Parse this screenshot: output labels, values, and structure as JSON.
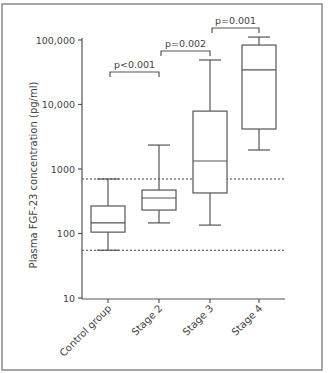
{
  "chart_data": {
    "type": "box",
    "title": "",
    "xlabel": "",
    "ylabel": "Plasma FGF-23 concentration (pg/ml)",
    "yscale": "log",
    "ylim": [
      10,
      100000
    ],
    "yticks": [
      10,
      100,
      1000,
      10000,
      100000
    ],
    "ytick_labels": [
      "10",
      "100",
      "1000",
      "10,000",
      "100,000"
    ],
    "categories": [
      "Control group",
      "Stage 2",
      "Stage 3",
      "Stage 4"
    ],
    "series": [
      {
        "name": "Control group",
        "whisker_low": 55,
        "q1": 105,
        "median": 146,
        "q3": 267,
        "whisker_high": 700
      },
      {
        "name": "Stage 2",
        "whisker_low": 146,
        "q1": 231,
        "median": 355,
        "q3": 472,
        "whisker_high": 2350
      },
      {
        "name": "Stage 3",
        "whisker_low": 135,
        "q1": 425,
        "median": 1330,
        "q3": 7900,
        "whisker_high": 49000
      },
      {
        "name": "Stage 4",
        "whisker_low": 1970,
        "q1": 4170,
        "median": 34300,
        "q3": 83500,
        "whisker_high": 111000
      }
    ],
    "reference_lines": [
      {
        "value": 700,
        "style": "dotted"
      },
      {
        "value": 55,
        "style": "dotted"
      }
    ],
    "annotations": [
      {
        "from": "Control group",
        "to": "Stage 2",
        "text": "p<0.001",
        "y_px": 72
      },
      {
        "from": "Stage 2",
        "to": "Stage 3",
        "text": "p=0.002",
        "y_px": 51
      },
      {
        "from": "Stage 3",
        "to": "Stage 4",
        "text": "p=0.001",
        "y_px": 28
      }
    ],
    "grid": false,
    "legend": null
  },
  "layout": {
    "frame": {
      "x": 2,
      "y": 4,
      "w": 320,
      "h": 366
    },
    "plot": {
      "x0": 82,
      "x1": 286,
      "y_axis_top": 38,
      "y_axis_bottom": 299
    },
    "log_ref": {
      "value": 10,
      "y": 298
    },
    "px_per_decade": 64.5,
    "box_half_width": 17,
    "cap_half_width": 11,
    "category_x": [
      108,
      159,
      210,
      259
    ]
  }
}
